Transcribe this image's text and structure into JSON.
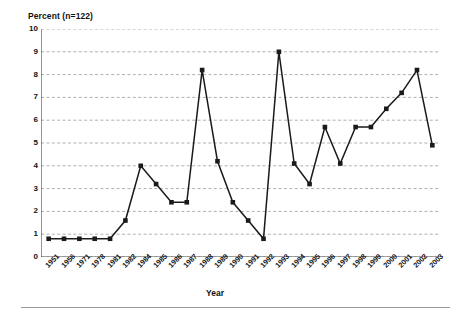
{
  "chart_data": {
    "type": "line",
    "title": "",
    "ylabel": "Percent (n=122)",
    "xlabel": "Year",
    "ylim": [
      0,
      10
    ],
    "yticks": [
      0,
      1,
      2,
      3,
      4,
      5,
      6,
      7,
      8,
      9,
      10
    ],
    "ytick_labels": [
      "0",
      "1",
      "2",
      "3",
      "4",
      "5",
      "6",
      "7",
      "8",
      "9",
      "10"
    ],
    "grid": "horizontal-dashed",
    "legend": "none",
    "marker": "filled-square",
    "line_color": "#1a1a1a",
    "grid_color": "#9a9a9a",
    "categories": [
      "1951",
      "1956",
      "1971",
      "1978",
      "1981",
      "1982",
      "1984",
      "1985",
      "1986",
      "1987",
      "1988",
      "1989",
      "1990",
      "1991",
      "1992",
      "1993",
      "1994",
      "1995",
      "1996",
      "1997",
      "1998",
      "1999",
      "2000",
      "2001",
      "2002",
      "2003"
    ],
    "values": [
      0.8,
      0.8,
      0.8,
      0.8,
      0.8,
      1.6,
      4.0,
      3.2,
      2.4,
      2.4,
      8.2,
      4.2,
      2.4,
      1.6,
      0.8,
      9.0,
      4.1,
      3.2,
      5.7,
      4.1,
      5.7,
      5.7,
      6.5,
      7.2,
      8.2,
      4.9
    ]
  }
}
